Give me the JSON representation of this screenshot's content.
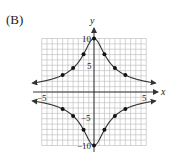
{
  "figure_label": "(B)",
  "chart_data": {
    "type": "line",
    "title": "",
    "xlabel": "x",
    "ylabel": "y",
    "xlim": [
      -5,
      5
    ],
    "ylim": [
      -10,
      10
    ],
    "grid": true,
    "grid_step": {
      "x": 0.5,
      "y": 1
    },
    "x_ticks_labeled": [
      -5,
      5
    ],
    "y_ticks_labeled": [
      10,
      5,
      -5,
      -10
    ],
    "series": [
      {
        "name": "upper branch",
        "equation": "y = 10/sqrt(1+x^2)",
        "points": [
          [
            -3,
            3.16
          ],
          [
            -2,
            4.47
          ],
          [
            -1,
            7.07
          ],
          [
            0,
            10
          ],
          [
            1,
            7.07
          ],
          [
            2,
            4.47
          ],
          [
            3,
            3.16
          ]
        ],
        "arrows_both_ends": true
      },
      {
        "name": "lower branch",
        "equation": "y = -10/sqrt(1+x^2)",
        "points": [
          [
            -3,
            -3.16
          ],
          [
            -2,
            -4.47
          ],
          [
            -1,
            -7.07
          ],
          [
            0,
            -10
          ],
          [
            1,
            -7.07
          ],
          [
            2,
            -4.47
          ],
          [
            3,
            -3.16
          ]
        ],
        "arrows_both_ends": true
      }
    ]
  },
  "ticks": {
    "x_neg5": "−5",
    "x_pos5": "5",
    "y_pos10": "10",
    "y_pos5": "5",
    "y_neg5": "−5",
    "y_neg10": "−10"
  },
  "axes": {
    "x": "x",
    "y": "y"
  },
  "colors": {
    "curve": "#333333",
    "grid": "#b8b8b8",
    "axis": "#222222"
  }
}
